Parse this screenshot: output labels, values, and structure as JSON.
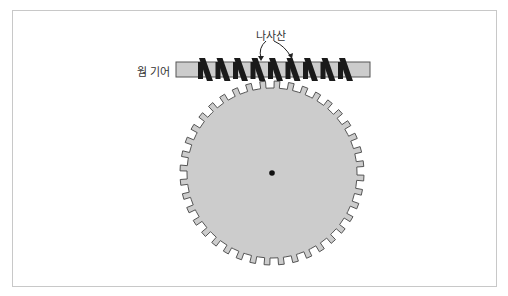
{
  "diagram": {
    "labels": {
      "thread": "나사산",
      "worm_gear": "웜 기어"
    },
    "worm": {
      "thread_count": 9,
      "rod_color": "#cccccc",
      "thread_color": "#1a1a1a"
    },
    "wheel": {
      "tooth_count": 40,
      "fill_color": "#cccccc",
      "stroke_color": "#555555",
      "center_dot_color": "#111111"
    },
    "frame_border_color": "#c8c8c8"
  }
}
